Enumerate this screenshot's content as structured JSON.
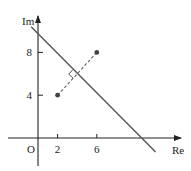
{
  "diagram": {
    "type": "argand-diagram",
    "axes": {
      "x_label": "Re",
      "y_label": "Im",
      "origin_label": "O",
      "x_ticks": [
        2,
        6
      ],
      "y_ticks": [
        4,
        8
      ]
    },
    "points": [
      {
        "name": "A",
        "re": 2,
        "im": 4
      },
      {
        "name": "B",
        "re": 6,
        "im": 8
      }
    ],
    "perpendicular_bisector": {
      "description": "solid line |z - (2+4i)| = |z - (6+8i)|",
      "equation": "Re + Im = 10",
      "from": {
        "re": -0.7,
        "im": 10.4
      },
      "to": {
        "re": 12,
        "im": -1.3
      }
    },
    "segment": {
      "style": "dashed",
      "from": "A",
      "to": "B"
    },
    "right_angle_marker": true,
    "colors": {
      "line": "#555555",
      "point": "#444444",
      "axis": "#222222"
    }
  }
}
